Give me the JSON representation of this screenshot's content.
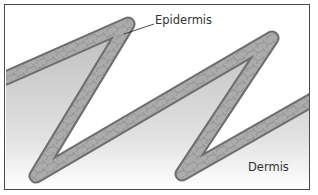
{
  "diagram": {
    "type": "cross-section illustration",
    "labels": {
      "epidermis": "Epidermis",
      "dermis": "Dermis"
    },
    "colors": {
      "frame": "#4a4a4a",
      "band_fill": "#a9a9a9",
      "band_edge": "#6e6e6e",
      "dermis_shade": "#c8c8c8",
      "background": "#ffffff",
      "text": "#333333"
    }
  }
}
